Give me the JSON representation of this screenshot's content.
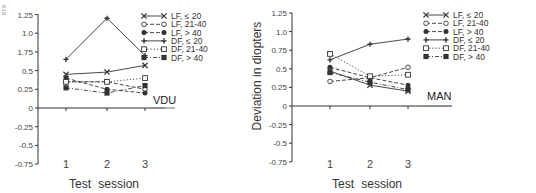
{
  "chart_data": [
    {
      "type": "line",
      "panel_label": "VDU",
      "title": "",
      "xlabel": "Test session",
      "ylabel": "Deviation in diopters",
      "categories": [
        "1",
        "2",
        "3"
      ],
      "y_tick_labels": [
        "1.25",
        "1.0",
        "1.75",
        "0.5",
        "0.25",
        "0",
        "-0.25",
        "-0.5",
        "-0.75"
      ],
      "ylim": [
        -0.75,
        1.25
      ],
      "grid": false,
      "legend_position": "upper right",
      "series": [
        {
          "name": "LF, ≤ 20",
          "marker": "x",
          "line": "solid",
          "values": [
            0.45,
            0.48,
            0.57
          ]
        },
        {
          "name": "LF, 21-40",
          "marker": "open-circle",
          "line": "dashed",
          "values": [
            0.35,
            0.35,
            0.25
          ]
        },
        {
          "name": "LF, > 40",
          "marker": "filled-circle",
          "line": "dashed",
          "values": [
            0.4,
            0.25,
            0.2
          ]
        },
        {
          "name": "DF, ≤ 20",
          "marker": "plus",
          "line": "solid",
          "values": [
            0.65,
            1.2,
            0.7
          ]
        },
        {
          "name": "DF, 21-40",
          "marker": "open-square",
          "line": "dotted",
          "values": [
            0.35,
            0.35,
            0.4
          ]
        },
        {
          "name": "DF, > 40",
          "marker": "filled-square",
          "line": "dash-dot",
          "values": [
            0.27,
            0.2,
            0.3
          ]
        }
      ]
    },
    {
      "type": "line",
      "panel_label": "MAN",
      "title": "",
      "xlabel": "Test session",
      "ylabel": "Deviation in diopters",
      "categories": [
        "1",
        "2",
        "3"
      ],
      "y_tick_labels": [
        "1.25",
        "1.0",
        "0.75",
        "0.5",
        "0.25",
        "0",
        "-0.25",
        "-0.5",
        "-0.75"
      ],
      "ylim": [
        -0.75,
        1.25
      ],
      "grid": false,
      "legend_position": "upper right",
      "series": [
        {
          "name": "LF, ≤ 20",
          "marker": "x",
          "line": "solid",
          "values": [
            0.47,
            0.28,
            0.2
          ]
        },
        {
          "name": "LF, 21-40",
          "marker": "open-circle",
          "line": "dashed",
          "values": [
            0.33,
            0.38,
            0.52
          ]
        },
        {
          "name": "LF, > 40",
          "marker": "filled-circle",
          "line": "dashed",
          "values": [
            0.52,
            0.38,
            0.28
          ]
        },
        {
          "name": "DF, ≤ 20",
          "marker": "plus",
          "line": "solid",
          "values": [
            0.62,
            0.83,
            0.9
          ]
        },
        {
          "name": "DF, 21-40",
          "marker": "open-square",
          "line": "dotted",
          "values": [
            0.7,
            0.4,
            0.42
          ]
        },
        {
          "name": "DF, > 40",
          "marker": "filled-square",
          "line": "dash-dot",
          "values": [
            0.45,
            0.32,
            0.22
          ]
        }
      ]
    }
  ],
  "colors": {
    "line": "#333333",
    "axis": "#333333",
    "text": "#333333"
  }
}
